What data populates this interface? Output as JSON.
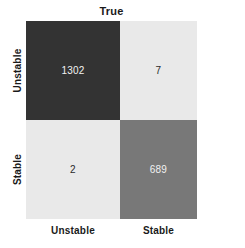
{
  "chart_data": {
    "type": "heatmap",
    "subtype": "confusion-matrix",
    "title": "True",
    "xlabel": "True",
    "ylabel": "Predicted",
    "x_title_position": "top",
    "y_title_position": "right",
    "grid": false,
    "legend": "none",
    "categories": [
      "Unstable",
      "Stable"
    ],
    "x_tick_labels": [
      "Unstable",
      "Stable"
    ],
    "y_tick_labels": [
      "Unstable",
      "Stable"
    ],
    "matrix": [
      [
        1302,
        7
      ],
      [
        2,
        689
      ]
    ],
    "cells": [
      {
        "row": 0,
        "col": 0,
        "row_label": "Unstable",
        "col_label": "Unstable",
        "value": "1302",
        "fill": "#333333",
        "text_color": "#f2f2f2"
      },
      {
        "row": 0,
        "col": 1,
        "row_label": "Unstable",
        "col_label": "Stable",
        "value": "7",
        "fill": "#e9e9e9",
        "text_color": "#2b2b2b"
      },
      {
        "row": 1,
        "col": 0,
        "row_label": "Stable",
        "col_label": "Unstable",
        "value": "2",
        "fill": "#e9e9e9",
        "text_color": "#2b2b2b"
      },
      {
        "row": 1,
        "col": 1,
        "row_label": "Stable",
        "col_label": "Stable",
        "value": "689",
        "fill": "#787878",
        "text_color": "#f2f2f2"
      }
    ],
    "colorscale": {
      "low": "#e9e9e9",
      "mid": "#787878",
      "high": "#333333"
    }
  },
  "axes": {
    "top_title": "True",
    "right_title": "Predicted",
    "row_labels": [
      "Unstable",
      "Stable"
    ],
    "col_labels": [
      "Unstable",
      "Stable"
    ]
  },
  "values": {
    "true_unstable_pred_unstable": "1302",
    "true_stable_pred_unstable": "7",
    "true_unstable_pred_stable": "2",
    "true_stable_pred_stable": "689"
  }
}
